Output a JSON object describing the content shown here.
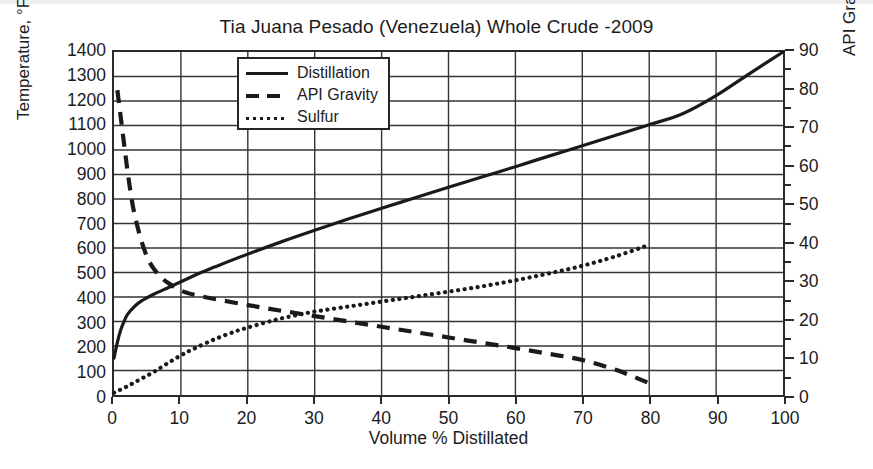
{
  "chart_data": {
    "type": "line",
    "title": "Tia Juana Pesado (Venezuela) Whole Crude -2009",
    "xlabel": "Volume % Distillated",
    "ylabel": "Temperature, °F",
    "ylabel_right": "API Gravity and wt% Sulfur x 10",
    "xlim": [
      0,
      100
    ],
    "ylim": [
      0,
      1400
    ],
    "ylim_right": [
      0,
      90
    ],
    "xticks": [
      0,
      10,
      20,
      30,
      40,
      50,
      60,
      70,
      80,
      90,
      100
    ],
    "yticks": [
      0,
      100,
      200,
      300,
      400,
      500,
      600,
      700,
      800,
      900,
      1000,
      1100,
      1200,
      1300,
      1400
    ],
    "yticks_right": [
      0,
      10,
      20,
      30,
      40,
      50,
      60,
      70,
      80,
      90
    ],
    "grid": true,
    "legend_position": "upper-left-inside",
    "series": [
      {
        "name": "Distillation",
        "axis": "left",
        "style": "solid",
        "color": "#1a1a1a",
        "x": [
          0,
          0.5,
          1,
          1.5,
          2,
          3,
          4,
          5,
          6,
          8,
          10,
          13,
          15,
          20,
          25,
          30,
          35,
          40,
          45,
          50,
          55,
          60,
          65,
          70,
          75,
          80,
          85,
          90,
          95,
          100
        ],
        "y": [
          150,
          215,
          265,
          300,
          328,
          360,
          382,
          398,
          412,
          437,
          462,
          500,
          522,
          575,
          625,
          672,
          718,
          762,
          805,
          848,
          890,
          932,
          975,
          1017,
          1060,
          1103,
          1148,
          1222,
          1312,
          1400
        ]
      },
      {
        "name": "API Gravity",
        "axis": "right",
        "style": "dashed",
        "color": "#1a1a1a",
        "x": [
          0.5,
          1,
          1.5,
          2,
          2.5,
          3,
          4,
          5,
          6,
          7,
          8,
          10,
          12,
          15,
          20,
          25,
          30,
          35,
          40,
          45,
          50,
          55,
          60,
          65,
          70,
          75,
          80
        ],
        "y": [
          80,
          73,
          66,
          59,
          53,
          48,
          41,
          36,
          33,
          31,
          29.5,
          27.4,
          26.3,
          25.2,
          23.6,
          22.1,
          20.7,
          19.3,
          17.9,
          16.5,
          15.1,
          13.7,
          12.3,
          10.8,
          9.2,
          6.6,
          3.1
        ]
      },
      {
        "name": "Sulfur",
        "axis": "right",
        "style": "dotted",
        "color": "#1a1a1a",
        "x": [
          0,
          2,
          4,
          6,
          8,
          10,
          12,
          15,
          18,
          20,
          23,
          25,
          28,
          30,
          35,
          40,
          45,
          50,
          55,
          60,
          65,
          70,
          75,
          80
        ],
        "y": [
          0.6,
          2.3,
          4.2,
          6.1,
          8.3,
          10.4,
          12.2,
          14.6,
          16.6,
          17.7,
          19.2,
          20.1,
          21.2,
          21.9,
          23.2,
          24.5,
          25.8,
          27.1,
          28.5,
          30.1,
          31.9,
          33.9,
          36.4,
          39.4
        ]
      }
    ]
  },
  "legend": {
    "items": [
      {
        "label": "Distillation",
        "style": "solid"
      },
      {
        "label": "API Gravity",
        "style": "dashed"
      },
      {
        "label": "Sulfur",
        "style": "dotted"
      }
    ]
  }
}
